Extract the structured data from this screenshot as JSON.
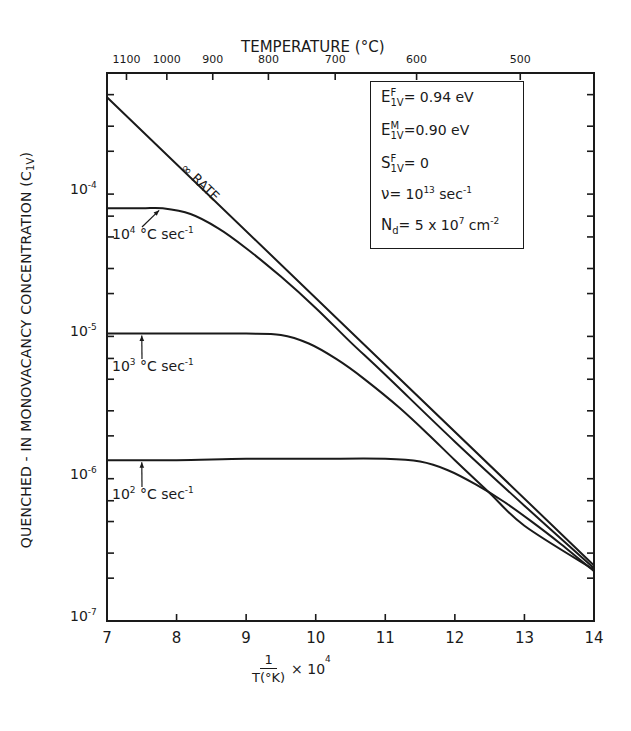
{
  "chart_data": {
    "type": "line",
    "title": "",
    "xlabel": "1/T(°K) × 10^4",
    "xlabel_parts": {
      "numerator": "1",
      "denominator": "T(°K)",
      "multiplier": "× 10",
      "exponent": "4"
    },
    "ylabel": "QUENCHED - IN  MONOVACANCY  CONCENTRATION (C1V)",
    "ylabel_parts": {
      "main": "QUENCHED - IN  MONOVACANCY  CONCENTRATION (C",
      "sub": "1V",
      "end": ")"
    },
    "top_axis_label": "TEMPERATURE (°C)",
    "xlim": [
      7,
      14
    ],
    "ylim": [
      1e-07,
      0.0007
    ],
    "yscale": "log",
    "grid": false,
    "x_ticks": [
      7,
      8,
      9,
      10,
      11,
      12,
      13,
      14
    ],
    "y_ticks": [
      {
        "base": "10",
        "exp": "-4",
        "value": 0.0001
      },
      {
        "base": "10",
        "exp": "-5",
        "value": 1e-05
      },
      {
        "base": "10",
        "exp": "-6",
        "value": 1e-06
      },
      {
        "base": "10",
        "exp": "-7",
        "value": 1e-07
      }
    ],
    "top_ticks": [
      {
        "label": "1100",
        "x": 7.28
      },
      {
        "label": "1000",
        "x": 7.86
      },
      {
        "label": "900",
        "x": 8.52
      },
      {
        "label": "800",
        "x": 9.32
      },
      {
        "label": "700",
        "x": 10.28
      },
      {
        "label": "600",
        "x": 11.45
      },
      {
        "label": "500",
        "x": 12.94
      }
    ],
    "series": [
      {
        "name": "∞ RATE",
        "x": [
          7.0,
          14.0
        ],
        "log10_y": [
          -3.32,
          -6.61
        ]
      },
      {
        "name": "10^4 °C sec^-1",
        "x": [
          7.0,
          7.5,
          7.8,
          8.2,
          8.6,
          9.0,
          9.5,
          10.0,
          10.5,
          11.0,
          12.0,
          13.0,
          14.0
        ],
        "log10_y": [
          -4.1,
          -4.1,
          -4.1,
          -4.14,
          -4.24,
          -4.38,
          -4.58,
          -4.8,
          -5.04,
          -5.27,
          -5.74,
          -6.19,
          -6.63
        ]
      },
      {
        "name": "10^3 °C sec^-1",
        "x": [
          7.0,
          8.0,
          9.0,
          9.5,
          9.9,
          10.3,
          10.7,
          11.2,
          11.6,
          12.0,
          12.5,
          13.0,
          14.0
        ],
        "log10_y": [
          -4.98,
          -4.98,
          -4.98,
          -4.99,
          -5.05,
          -5.16,
          -5.3,
          -5.5,
          -5.68,
          -5.87,
          -6.1,
          -6.33,
          -6.64
        ]
      },
      {
        "name": "10^2 °C sec^-1",
        "x": [
          7.0,
          8.0,
          9.0,
          10.0,
          11.0,
          11.5,
          11.9,
          12.3,
          12.7,
          13.1,
          13.5,
          14.0
        ],
        "log10_y": [
          -5.87,
          -5.87,
          -5.86,
          -5.86,
          -5.86,
          -5.88,
          -5.94,
          -6.04,
          -6.16,
          -6.3,
          -6.45,
          -6.65
        ]
      }
    ],
    "annotations": {
      "rate_label": "∞ RATE",
      "curve_labels": [
        {
          "base": "10",
          "exp": "4",
          "unit": "°C  sec",
          "unit_exp": "-1",
          "arrow_to_x": 7.75,
          "arrow_to_log10_y": -4.1
        },
        {
          "base": "10",
          "exp": "3",
          "unit": "°C  sec",
          "unit_exp": "-1",
          "arrow_to_x": 7.5,
          "arrow_to_log10_y": -4.98
        },
        {
          "base": "10",
          "exp": "2",
          "unit": "°C  sec",
          "unit_exp": "-1",
          "arrow_to_x": 7.5,
          "arrow_to_log10_y": -5.87
        }
      ]
    },
    "legend_box": {
      "position": "top-right (inside plot)",
      "entries": [
        {
          "sym": "E",
          "sup": "F",
          "sub": "1V",
          "text": "= 0.94 eV"
        },
        {
          "sym": "E",
          "sup": "M",
          "sub": "1V",
          "text": "=0.90 eV"
        },
        {
          "sym": "S",
          "sup": "F",
          "sub": "1V",
          "text": "= 0"
        },
        {
          "sym": "ν",
          "sup": "",
          "sub": "",
          "text": "= 10",
          "text_sup": "13",
          "text_after": " sec",
          "text_after_sup": "-1"
        },
        {
          "sym": "N",
          "sup": "",
          "sub": "d",
          "text": "= 5 x 10",
          "text_sup": "7",
          "text_after": " cm",
          "text_after_sup": "-2"
        }
      ]
    }
  },
  "style": {
    "ink": "#1a1a1a",
    "background": "#ffffff"
  }
}
